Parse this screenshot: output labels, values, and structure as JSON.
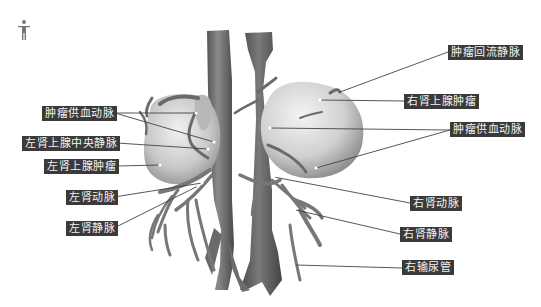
{
  "diagram": {
    "orientation_icon": "person-figure-icon",
    "colors": {
      "label_bg": "#3a3a3a",
      "label_text": "#f2f2f2",
      "leader_line": "#444444",
      "organ_fill": "#c8c8c8",
      "vessel_fill": "#6e6e6e"
    },
    "labels_left": [
      {
        "id": "left-tumor-feeding-artery",
        "text": "肿瘤供血动脉"
      },
      {
        "id": "left-adrenal-central-vein",
        "text": "左肾上腺中央静脉"
      },
      {
        "id": "left-adrenal-tumor",
        "text": "左肾上腺肿瘤"
      },
      {
        "id": "left-renal-artery",
        "text": "左肾动脉"
      },
      {
        "id": "left-renal-vein",
        "text": "左肾静脉"
      }
    ],
    "labels_right": [
      {
        "id": "tumor-draining-vein",
        "text": "肿瘤回流静脉"
      },
      {
        "id": "right-adrenal-tumor",
        "text": "右肾上腺肿瘤"
      },
      {
        "id": "right-tumor-feeding-artery",
        "text": "肿瘤供血动脉"
      },
      {
        "id": "right-renal-artery",
        "text": "右肾动脉"
      },
      {
        "id": "right-renal-vein",
        "text": "右肾静脉"
      },
      {
        "id": "right-ureter",
        "text": "右输尿管"
      }
    ]
  }
}
